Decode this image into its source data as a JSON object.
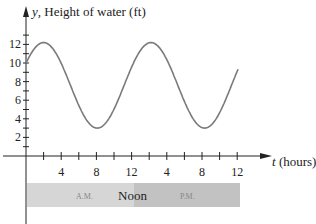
{
  "chart_data": {
    "type": "line",
    "title": "",
    "ylabel": "y, Height of water (ft)",
    "xlabel": "t (hours)",
    "ylabel_var": "y",
    "ylabel_text": ", Height of water (ft)",
    "xlabel_var": "t",
    "xlabel_text": " (hours)",
    "ylim": [
      0,
      13
    ],
    "xlim": [
      0,
      26
    ],
    "yticks": [
      2,
      4,
      6,
      8,
      10,
      12
    ],
    "ytick_labels": [
      "2",
      "4",
      "6",
      "8",
      "10",
      "12"
    ],
    "xticks": [
      4,
      8,
      12,
      16,
      20,
      24
    ],
    "xtick_labels": [
      "4",
      "8",
      "12",
      "4",
      "8",
      "12"
    ],
    "grid": false,
    "series": [
      {
        "name": "Water height",
        "x": [
          0,
          2,
          5,
          8,
          11,
          14,
          17,
          20,
          22,
          24
        ],
        "y": [
          10,
          12.2,
          8.0,
          3.0,
          6.8,
          12.2,
          8.5,
          3.0,
          5.5,
          9.5
        ]
      }
    ],
    "band": {
      "am_label": "A.M.",
      "noon_label": "Noon",
      "pm_label": "P.M."
    }
  }
}
